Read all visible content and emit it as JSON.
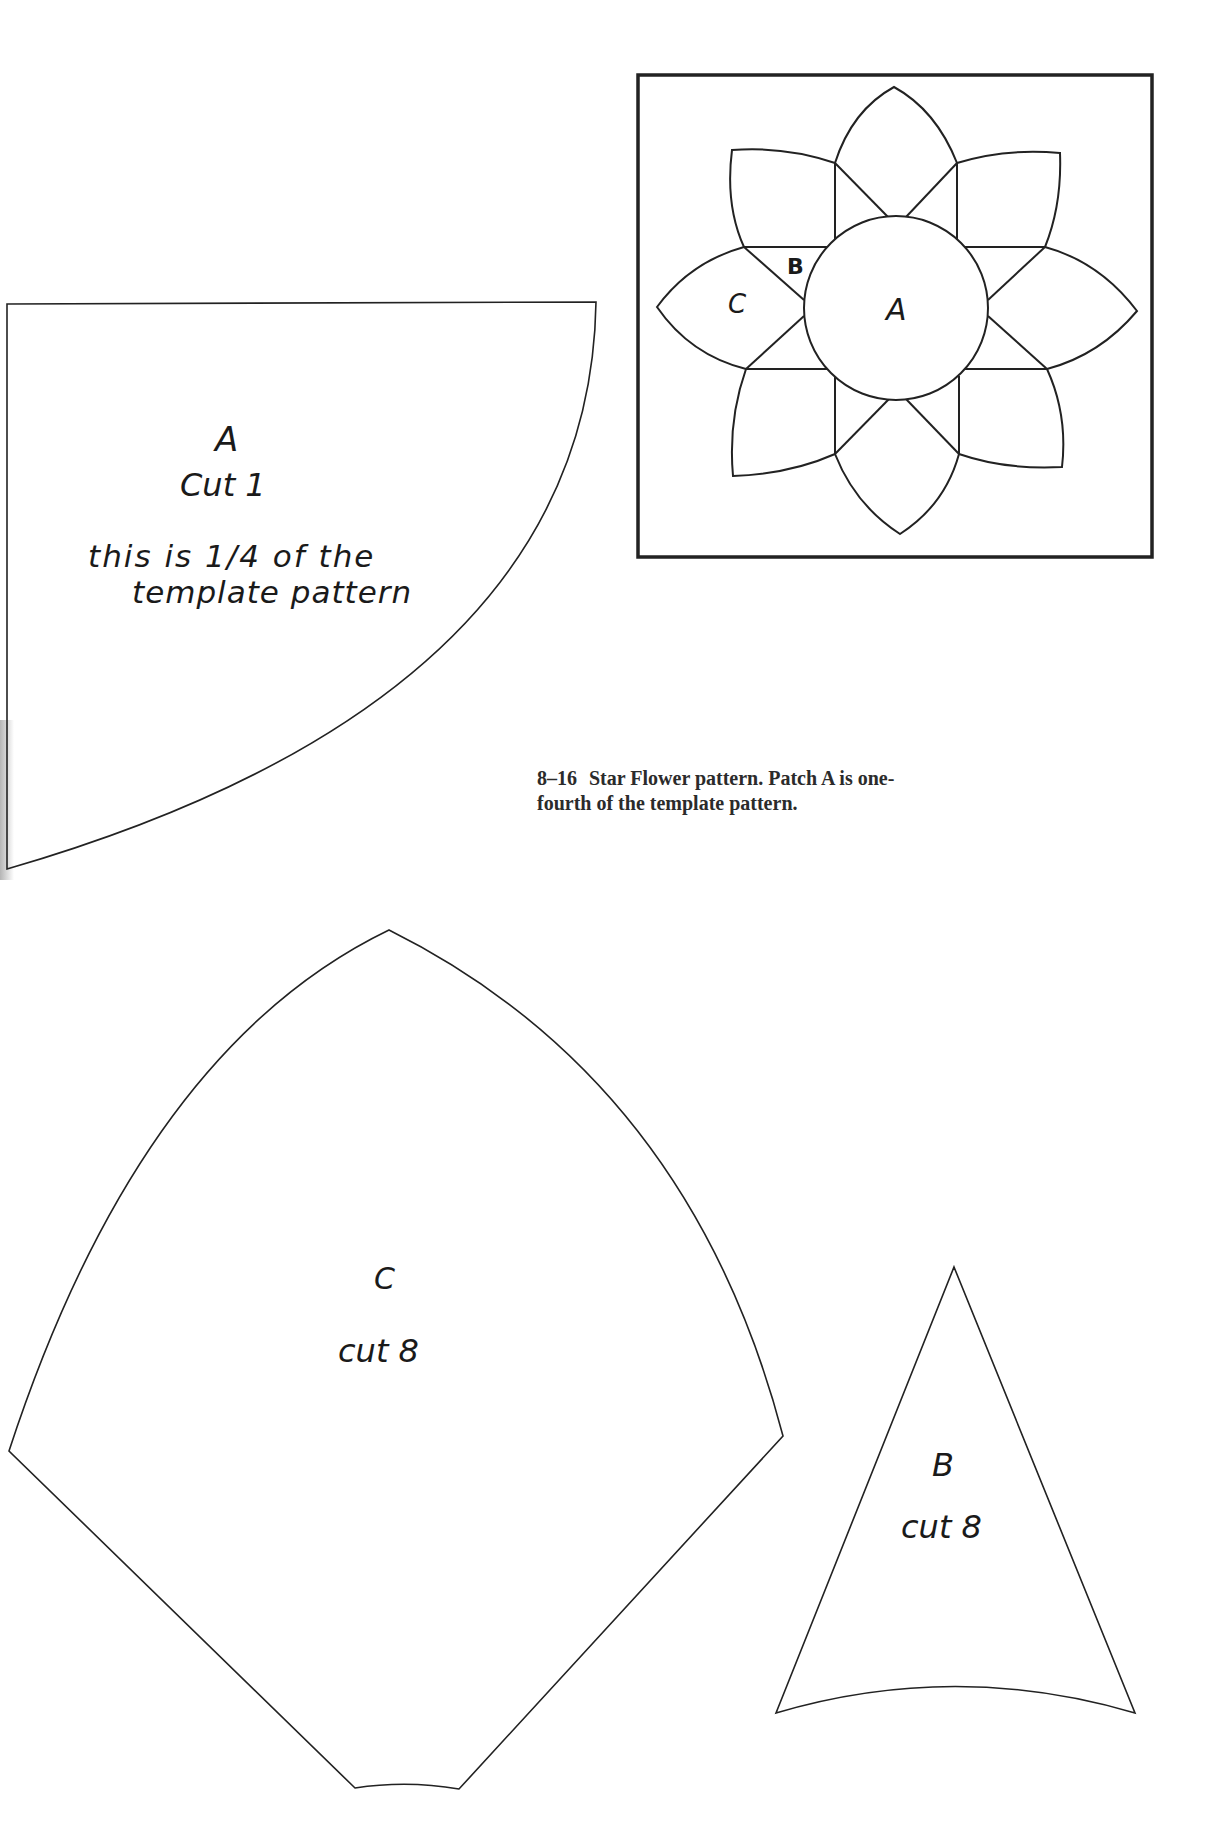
{
  "page": {
    "background": "#ffffff",
    "line_color": "#222222"
  },
  "block_diagram": {
    "name": "Star Flower block",
    "labels": {
      "a": "A",
      "b": "B",
      "c": "C"
    }
  },
  "template_a": {
    "letter": "A",
    "cut": "Cut 1",
    "note_line1": "this is 1/4 of the",
    "note_line2": "template pattern"
  },
  "template_c": {
    "letter": "C",
    "cut": "cut 8"
  },
  "template_b": {
    "letter": "B",
    "cut": "cut 8"
  },
  "caption": {
    "figure_number": "8–16",
    "text_line1": "Star Flower pattern. Patch A is one-",
    "text_line2": "fourth of the template pattern."
  }
}
